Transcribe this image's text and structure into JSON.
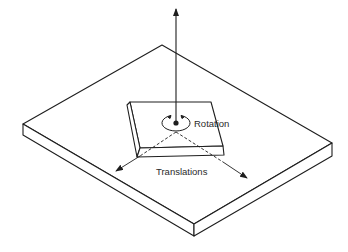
{
  "diagram": {
    "type": "isometric-illustration",
    "labels": {
      "rotation": "Rotation",
      "translations": "Translations"
    },
    "colors": {
      "line": "#1e1e1e",
      "background": "#ffffff"
    }
  }
}
